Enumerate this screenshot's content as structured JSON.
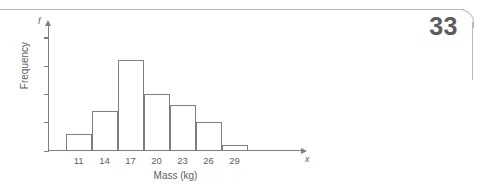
{
  "page": {
    "number": "33"
  },
  "chart_data": {
    "type": "bar",
    "title": "",
    "subtitle": "",
    "xlabel": "Mass (kg)",
    "ylabel": "Frequency",
    "x_axis_symbol": "x",
    "y_axis_symbol": "f",
    "categories": [
      "11",
      "14",
      "17",
      "20",
      "23",
      "26",
      "29"
    ],
    "values": [
      3,
      7,
      16,
      10,
      8,
      5,
      1
    ],
    "xtick_labels": [
      "11",
      "14",
      "17",
      "20",
      "23",
      "26",
      "29"
    ],
    "ytick_labels": [
      "0",
      "5",
      "10",
      "15",
      "20"
    ],
    "ytick_values": [
      0,
      5,
      10,
      15,
      20
    ],
    "ylim": [
      0,
      22
    ],
    "grid": false,
    "legend": null,
    "bar_fill_color": "#ffffff",
    "bar_edge_color": "#7d7d84",
    "axis_color": "#7d7d84",
    "text_color": "#5d5d62"
  }
}
